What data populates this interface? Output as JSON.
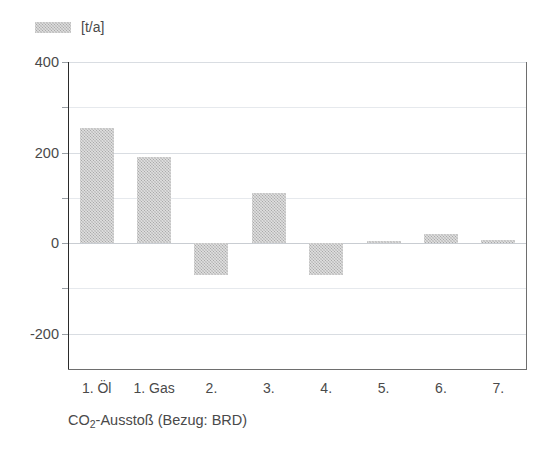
{
  "legend": {
    "swatch_name": "series-swatch",
    "label": "[t/a]"
  },
  "caption": {
    "prefix": "CO",
    "sub": "2",
    "suffix": "-Ausstoß (Bezug: BRD)",
    "full": "CO2-Ausstoß (Bezug: BRD)"
  },
  "axis": {
    "y_ticks_major": [
      "400",
      "200",
      "0",
      "-200"
    ],
    "y_ticks_major_values": [
      400,
      200,
      0,
      -200
    ],
    "y_ticks_minor_values": [
      300,
      100,
      -100
    ],
    "y_min": -280,
    "y_max": 400
  },
  "colors": {
    "bar_fill": "#a9a9a9",
    "grid": "#d9dde2",
    "axis": "#2b2b2b",
    "frame": "#6e6e6e",
    "text": "#4a4a4a",
    "background": "#ffffff"
  },
  "chart_data": {
    "type": "bar",
    "title": "",
    "subtitle": "",
    "xlabel": "",
    "ylabel": "[t/a]",
    "categories": [
      "1. Öl",
      "1. Gas",
      "2.",
      "3.",
      "4.",
      "5.",
      "6.",
      "7."
    ],
    "values": [
      255,
      190,
      -70,
      110,
      -70,
      5,
      20,
      8
    ],
    "series": [
      {
        "name": "[t/a]",
        "values": [
          255,
          190,
          -70,
          110,
          -70,
          5,
          20,
          8
        ]
      }
    ],
    "ylim": [
      -280,
      400
    ],
    "yticks": [
      400,
      200,
      0,
      -200
    ],
    "yticks_minor": [
      300,
      100,
      -100
    ],
    "grid": true,
    "legend_position": "top-left",
    "annotations": [
      "CO2-Ausstoß (Bezug: BRD)"
    ]
  }
}
